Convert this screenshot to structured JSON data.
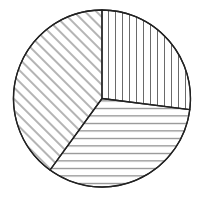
{
  "chart_data": {
    "type": "pie",
    "title": "",
    "start_angle": "12 o'clock",
    "direction": "clockwise",
    "legend": "none",
    "slices": [
      {
        "label": "",
        "value": 27,
        "hatch": "vertical"
      },
      {
        "label": "",
        "value": 33,
        "hatch": "horizontal"
      },
      {
        "label": "",
        "value": 40,
        "hatch": "diagonal"
      }
    ]
  },
  "colors": {
    "stroke": "#222222",
    "hatch": "#444444",
    "background": "#ffffff"
  }
}
